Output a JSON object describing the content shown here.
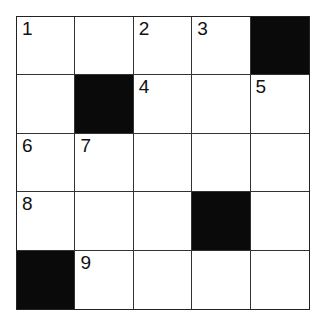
{
  "puzzle": {
    "rows": 5,
    "cols": 5,
    "cells": [
      [
        {
          "n": "1"
        },
        {
          "n": ""
        },
        {
          "n": "2"
        },
        {
          "n": "3"
        },
        {
          "black": true
        }
      ],
      [
        {
          "n": ""
        },
        {
          "black": true
        },
        {
          "n": "4"
        },
        {
          "n": ""
        },
        {
          "n": "5"
        }
      ],
      [
        {
          "n": "6"
        },
        {
          "n": "7"
        },
        {
          "n": ""
        },
        {
          "n": ""
        },
        {
          "n": ""
        }
      ],
      [
        {
          "n": "8"
        },
        {
          "n": ""
        },
        {
          "n": ""
        },
        {
          "black": true
        },
        {
          "n": ""
        }
      ],
      [
        {
          "black": true
        },
        {
          "n": "9"
        },
        {
          "n": ""
        },
        {
          "n": ""
        },
        {
          "n": ""
        }
      ]
    ]
  }
}
